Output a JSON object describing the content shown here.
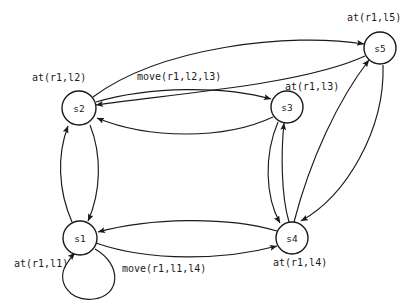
{
  "diagram": {
    "colors": {
      "background": "#ffffff",
      "stroke": "#1a1a1a",
      "node_fill": "#ffffff"
    },
    "nodes": [
      {
        "id": "s1",
        "label": "s1",
        "cx": 80,
        "cy": 238,
        "r": 17,
        "state_label": "at(r1,l1)"
      },
      {
        "id": "s2",
        "label": "s2",
        "cx": 79,
        "cy": 108,
        "r": 17,
        "state_label": "at(r1,l2)"
      },
      {
        "id": "s3",
        "label": "s3",
        "cx": 287,
        "cy": 107,
        "r": 16,
        "state_label": "at(r1,l3)"
      },
      {
        "id": "s4",
        "label": "s4",
        "cx": 292,
        "cy": 238,
        "r": 16,
        "state_label": "at(r1,l4)"
      },
      {
        "id": "s5",
        "label": "s5",
        "cx": 380,
        "cy": 48,
        "r": 16,
        "state_label": "at(r1,l5)"
      }
    ],
    "state_labels": [
      {
        "name": "label-s1",
        "text": "at(r1,l1)",
        "x": 14,
        "y": 267
      },
      {
        "name": "label-s2",
        "text": "at(r1,l2)",
        "x": 32,
        "y": 81
      },
      {
        "name": "label-s3",
        "text": "at(r1,l3)",
        "x": 285,
        "y": 90
      },
      {
        "name": "label-s4",
        "text": "at(r1,l4)",
        "x": 273,
        "y": 266
      },
      {
        "name": "label-s5",
        "text": "at(r1,l5)",
        "x": 347,
        "y": 21
      }
    ],
    "action_labels": [
      {
        "name": "action-s2-s3",
        "text": "move(r1,l2,l3)",
        "x": 137,
        "y": 80
      },
      {
        "name": "action-s1-s4",
        "text": "move(r1,l1,l4)",
        "x": 122,
        "y": 272
      }
    ],
    "edges": [
      {
        "from": "s1",
        "to": "s2",
        "kind": "curved"
      },
      {
        "from": "s2",
        "to": "s1",
        "kind": "curved"
      },
      {
        "from": "s2",
        "to": "s3",
        "kind": "curved",
        "action": "move(r1,l2,l3)"
      },
      {
        "from": "s3",
        "to": "s2",
        "kind": "curved"
      },
      {
        "from": "s3",
        "to": "s4",
        "kind": "curved"
      },
      {
        "from": "s4",
        "to": "s3",
        "kind": "curved"
      },
      {
        "from": "s1",
        "to": "s4",
        "kind": "curved",
        "action": "move(r1,l1,l4)"
      },
      {
        "from": "s4",
        "to": "s1",
        "kind": "curved"
      },
      {
        "from": "s2",
        "to": "s5",
        "kind": "curved"
      },
      {
        "from": "s5",
        "to": "s2",
        "kind": "curved"
      },
      {
        "from": "s4",
        "to": "s5",
        "kind": "curved"
      },
      {
        "from": "s5",
        "to": "s4",
        "kind": "curved"
      },
      {
        "from": "s1",
        "to": "s1",
        "kind": "self-loop"
      }
    ]
  }
}
